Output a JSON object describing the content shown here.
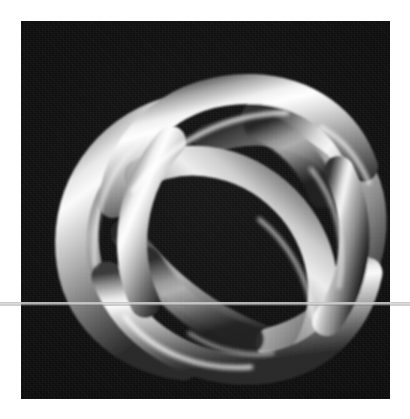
{
  "figure": {
    "kind": "3d-render",
    "colorspace": "grayscale",
    "background_color": "#0d0d0d",
    "matte_color": "#ffffff",
    "tube_highlight_color": "#f2f2f2",
    "tube_midtone_color": "#a8a8a8",
    "tube_shadow_color": "#4a4a4a",
    "tube_core_shadow_color": "#2c2c2c",
    "caption": "",
    "title": ""
  },
  "frame": {
    "x": 21,
    "y": 21,
    "width": 369,
    "height": 378,
    "border_label": "white matte border"
  },
  "artifact": {
    "type": "horizontal-scanline",
    "y": 302,
    "height": 3,
    "color": "#d4d4d4",
    "spans_full_width": true
  },
  "canvas": {
    "width": 410,
    "height": 419
  },
  "chart_data": {
    "type": "scatter",
    "title": "",
    "xlabel": "",
    "ylabel": "",
    "note": "not a chart - photographic/rendered image",
    "categories": [],
    "values": []
  }
}
